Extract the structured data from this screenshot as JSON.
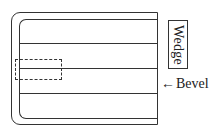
{
  "diagram": {
    "labels": {
      "wedge": "Wedge",
      "bevel": "Bevel",
      "bevel_arrow": "←"
    },
    "shapes": {
      "outer_frame": "rounded-left rectangle",
      "inner_frame": "rounded-left rectangle",
      "horizontal_dividers": 3,
      "dashed_region": "dashed rectangle on left edge"
    }
  }
}
